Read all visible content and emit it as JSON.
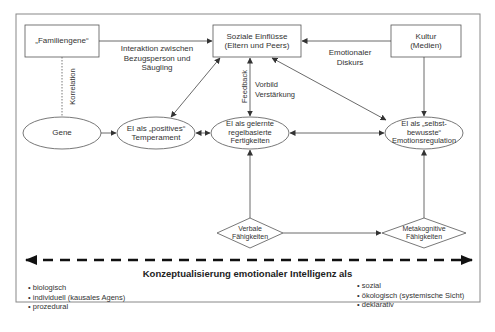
{
  "diagram": {
    "nodes": {
      "familiengene": {
        "label": "„Familiengene“",
        "shape": "rect"
      },
      "soziale": {
        "line1": "Soziale Einflüsse",
        "line2": "(Eltern und Peers)",
        "shape": "rect"
      },
      "kultur": {
        "line1": "Kultur",
        "line2": "(Medien)",
        "shape": "rect"
      },
      "gene": {
        "label": "Gene",
        "shape": "ellipse"
      },
      "temperament": {
        "line1": "EI als „positives“",
        "line2": "Temperament",
        "shape": "ellipse"
      },
      "fertigkeiten": {
        "line1": "EI als gelernte",
        "line2": "regelbasierte",
        "line3": "Fertigkeiten",
        "shape": "ellipse"
      },
      "emotionsregulation": {
        "line1": "EI als „selbst-",
        "line2": "bewusste“",
        "line3": "Emotionsregulation",
        "shape": "ellipse"
      },
      "verbale": {
        "line1": "Verbale",
        "line2": "Fähigkeiten",
        "shape": "diamond"
      },
      "metakognitive": {
        "line1": "Metakognitive",
        "line2": "Fähigkeiten",
        "shape": "diamond"
      }
    },
    "edge_labels": {
      "interaktion": {
        "line1": "Interaktion zwischen",
        "line2": "Bezugsperson und",
        "line3": "Säugling"
      },
      "emotionaler": {
        "line1": "Emotionaler",
        "line2": "Diskurs"
      },
      "korrelation": "Korrelation",
      "feedback": "Feedback",
      "vorbild": {
        "line1": "Vorbild",
        "line2": "Verstärkung"
      }
    },
    "axis": {
      "title": "Konzeptualisierung emotionaler Intelligenz als",
      "left_items": [
        "• biologisch",
        "• individuell (kausales Agens)",
        "• prozedural"
      ],
      "right_items": [
        "• sozial",
        "• ökologisch (systemische Sicht)",
        "• deklarativ"
      ]
    },
    "colors": {
      "line": "#444444",
      "frame": "#888888",
      "text": "#333333",
      "background": "#ffffff"
    }
  }
}
